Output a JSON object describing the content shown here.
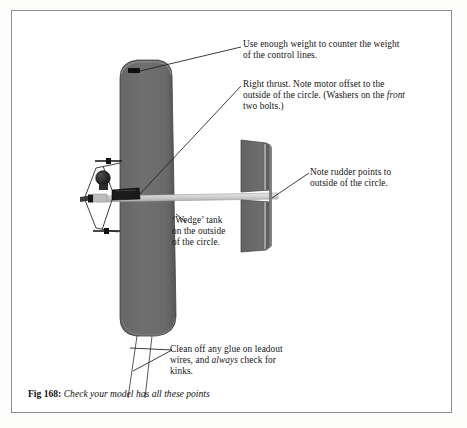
{
  "figure": {
    "caption_label": "Fig 168:",
    "caption_text": "Check your model has all these points"
  },
  "annotations": {
    "weight": {
      "line1": "Use enough weight to counter the weight",
      "line2": "of the control lines."
    },
    "thrust": {
      "line1": "Right thrust. Note motor offset to the",
      "line2_a": "outside of the circle. (Washers on the ",
      "line2_em": "front",
      "line3": "two bolts.)"
    },
    "rudder": {
      "line1": "Note rudder points to",
      "line2": "outside of the circle."
    },
    "tank": {
      "line1": "‘Wedge’ tank",
      "line2": "on the outside",
      "line3": "of the circle."
    },
    "leadout": {
      "line1": "Clean off any glue on leadout",
      "line2_a": "wires, and ",
      "line2_em": "always",
      "line2_b": " check for",
      "line3": "kinks."
    }
  },
  "colors": {
    "page_background": "#fdfdfc",
    "frame_border": "#8c8c8c",
    "wing_fill": "#6d6d6d",
    "wing_edge": "#4a4a4a",
    "tail_fill": "#6a6a6a",
    "boom_fill": "#d2d2d2",
    "leader_line": "#222222",
    "text": "#151515"
  },
  "parts": {
    "wing": "wing-planform",
    "tip_weight": "tip-weight-box",
    "tailplane_upper": "tailplane-upper-half",
    "tailplane_lower": "tailplane-lower-half",
    "rudder_edge": "rudder-trailing-edge",
    "fuselage_boom": "fuselage-boom",
    "motor": "engine-cylinder",
    "propeller": "propeller",
    "wedge_tank": "wedge-tank",
    "undercarriage": "undercarriage-legs",
    "leadout_wires": "leadout-wires"
  }
}
